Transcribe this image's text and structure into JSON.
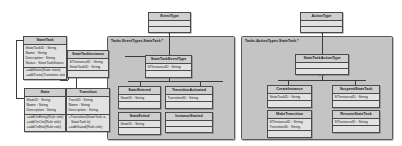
{
  "diagram": {
    "kind": "uml-class-diagram",
    "background": "#ffffff",
    "box_fill": "#d8d8d8",
    "package_fill": "#c4c4c4",
    "line_color": "#3c3c3c"
  },
  "top_classes": {
    "event_type": {
      "title": "EventType",
      "compartments": [
        "",
        ""
      ]
    },
    "action_type": {
      "title": "ActionType",
      "compartments": [
        "",
        ""
      ]
    }
  },
  "packages": {
    "event_package": {
      "label": "Tasks.EventTypes.StateTask.*"
    },
    "action_package": {
      "label": "Tasks.ActionTypes.StateTask.*"
    }
  },
  "classes": {
    "state_task": {
      "title": "StateTask",
      "attributes": [
        "StateTaskID : String",
        "Name : String",
        "Description : String",
        "Status : StateTaskStatus"
      ],
      "operations": [
        "+addState(State state)",
        "+addTrans(Transition state)"
      ]
    },
    "state_task_instance": {
      "title": "StateTaskInstance",
      "attributes": [
        "STInstanceID : String",
        "StateTaskID : String"
      ]
    },
    "state": {
      "title": "State",
      "attributes": [
        "StateID : String",
        "Name : String",
        "Description : String"
      ],
      "operations": [
        "+addOnEntry(Rule role)",
        "+addOnOut(Rule role)",
        "+addOnExit(Rule role)"
      ]
    },
    "transition": {
      "title": "Transition",
      "attributes": [
        "TransID : String",
        "Name : String",
        "Description : String"
      ],
      "operations": [
        "+Transition(StateTask a,",
        "StateTask b)",
        "+addGuard(Rule role)"
      ]
    },
    "state_task_event_type": {
      "title": "StateTaskEventType",
      "attributes": [
        "STInstanceID : String"
      ]
    },
    "state_entered": {
      "title": "StateEntered",
      "attributes": [
        "StateID : String"
      ]
    },
    "transition_activated": {
      "title": "TransitionActivated",
      "attributes": [
        "TransitionID : String"
      ]
    },
    "state_exited": {
      "title": "StateExited",
      "attributes": [
        "StateID : String"
      ]
    },
    "instance_started": {
      "title": "InstanceStarted",
      "attributes": [
        ""
      ]
    },
    "state_task_action_type": {
      "title": "StateTaskActionType",
      "attributes": [
        ""
      ]
    },
    "create_instance": {
      "title": "CreateInstance",
      "attributes": [
        "StateTaskID : String"
      ]
    },
    "suspend_state_task": {
      "title": "SuspendStateTask",
      "attributes": [
        "STInstanceID : String"
      ]
    },
    "make_transition": {
      "title": "MakeTransition",
      "attributes": [
        "STInstanceID : String",
        "TransitionID : String"
      ]
    },
    "resume_state_task": {
      "title": "ResumeStateTask",
      "attributes": [
        "STInstanceID : String"
      ]
    }
  }
}
